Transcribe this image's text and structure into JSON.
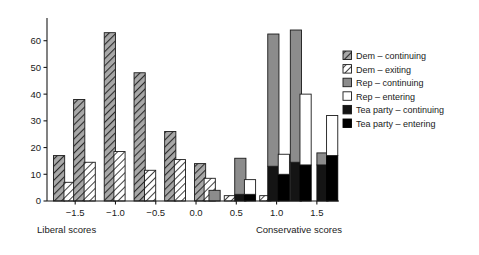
{
  "chart_data": {
    "type": "bar",
    "title": "",
    "xlabel_left": "Liberal scores",
    "xlabel_right": "Conservative scores",
    "ylabel": "",
    "xlim": [
      -1.85,
      1.75
    ],
    "ylim": [
      0,
      67
    ],
    "yticks": [
      0,
      10,
      20,
      30,
      40,
      50,
      60
    ],
    "xticks": [
      -1.5,
      -1.0,
      -0.5,
      0.0,
      0.5,
      1.0,
      1.5
    ],
    "xticklabels": [
      "−1.5",
      "−1.0",
      "−0.5",
      "0.0",
      "0.5",
      "1.0",
      "1.5"
    ],
    "grid": false,
    "legend_position": "right",
    "series": [
      {
        "name": "Dem – continuing",
        "key": "dem_cont",
        "fill": "#8c8c8c",
        "hatch": "diagonal",
        "edge": "#1a1a1a"
      },
      {
        "name": "Dem – exiting",
        "key": "dem_exit",
        "fill": "#ffffff",
        "hatch": "diagonal",
        "edge": "#1a1a1a"
      },
      {
        "name": "Rep – continuing",
        "key": "rep_cont",
        "fill": "#8c8c8c",
        "hatch": "none",
        "edge": "#1a1a1a"
      },
      {
        "name": "Rep – entering",
        "key": "rep_enter",
        "fill": "#ffffff",
        "hatch": "none",
        "edge": "#1a1a1a"
      },
      {
        "name": "Tea party – continuing",
        "key": "tea_cont",
        "fill": "#141414",
        "hatch": "none",
        "edge": "#141414"
      },
      {
        "name": "Tea party – entering",
        "key": "tea_enter",
        "fill": "#000000",
        "hatch": "none",
        "edge": "#000000"
      }
    ],
    "bars": [
      {
        "x": -1.7,
        "stack": [
          {
            "key": "dem_cont",
            "value": 17
          }
        ]
      },
      {
        "x": -1.57,
        "stack": [
          {
            "key": "dem_exit",
            "value": 7
          }
        ]
      },
      {
        "x": -1.45,
        "stack": [
          {
            "key": "dem_cont",
            "value": 38
          }
        ]
      },
      {
        "x": -1.32,
        "stack": [
          {
            "key": "dem_exit",
            "value": 14.5
          }
        ]
      },
      {
        "x": -1.07,
        "stack": [
          {
            "key": "dem_cont",
            "value": 63
          }
        ]
      },
      {
        "x": -0.95,
        "stack": [
          {
            "key": "dem_exit",
            "value": 18.5
          }
        ]
      },
      {
        "x": -0.7,
        "stack": [
          {
            "key": "dem_cont",
            "value": 48
          }
        ]
      },
      {
        "x": -0.57,
        "stack": [
          {
            "key": "dem_exit",
            "value": 11.5
          }
        ]
      },
      {
        "x": -0.32,
        "stack": [
          {
            "key": "dem_cont",
            "value": 26
          }
        ]
      },
      {
        "x": -0.2,
        "stack": [
          {
            "key": "dem_exit",
            "value": 15.5
          }
        ]
      },
      {
        "x": 0.05,
        "stack": [
          {
            "key": "dem_cont",
            "value": 14
          }
        ]
      },
      {
        "x": 0.17,
        "stack": [
          {
            "key": "dem_exit",
            "value": 8.5
          }
        ]
      },
      {
        "x": 0.23,
        "stack": [
          {
            "key": "rep_cont",
            "value": 4
          }
        ]
      },
      {
        "x": 0.42,
        "stack": [
          {
            "key": "dem_exit",
            "value": 2
          }
        ]
      },
      {
        "x": 0.55,
        "stack": [
          {
            "key": "tea_cont",
            "value": 2.5
          },
          {
            "key": "rep_cont",
            "value": 13.5
          }
        ]
      },
      {
        "x": 0.67,
        "stack": [
          {
            "key": "tea_enter",
            "value": 2.5
          },
          {
            "key": "rep_enter",
            "value": 5.5
          }
        ]
      },
      {
        "x": 0.86,
        "stack": [
          {
            "key": "dem_exit",
            "value": 2
          }
        ]
      },
      {
        "x": 0.96,
        "stack": [
          {
            "key": "tea_cont",
            "value": 13
          },
          {
            "key": "rep_cont",
            "value": 49.5
          }
        ]
      },
      {
        "x": 1.09,
        "stack": [
          {
            "key": "tea_enter",
            "value": 10
          },
          {
            "key": "rep_enter",
            "value": 7.5
          }
        ]
      },
      {
        "x": 1.24,
        "stack": [
          {
            "key": "tea_cont",
            "value": 14.5
          },
          {
            "key": "rep_cont",
            "value": 49.5
          }
        ]
      },
      {
        "x": 1.36,
        "stack": [
          {
            "key": "tea_enter",
            "value": 13.5
          },
          {
            "key": "rep_enter",
            "value": 26.5
          }
        ]
      },
      {
        "x": 1.57,
        "stack": [
          {
            "key": "tea_cont",
            "value": 13.5
          },
          {
            "key": "rep_cont",
            "value": 4.5
          }
        ]
      },
      {
        "x": 1.69,
        "stack": [
          {
            "key": "tea_enter",
            "value": 17
          },
          {
            "key": "rep_enter",
            "value": 15
          }
        ]
      }
    ]
  },
  "legend": {
    "items": [
      {
        "label": "Dem – continuing"
      },
      {
        "label": "Dem – exiting"
      },
      {
        "label": "Rep – continuing"
      },
      {
        "label": "Rep – entering"
      },
      {
        "label": "Tea party – continuing"
      },
      {
        "label": "Tea party – entering"
      }
    ]
  },
  "colors": {
    "gray": "#8c8c8c",
    "white": "#ffffff",
    "black": "#141414",
    "axis": "#1a1a1a"
  }
}
